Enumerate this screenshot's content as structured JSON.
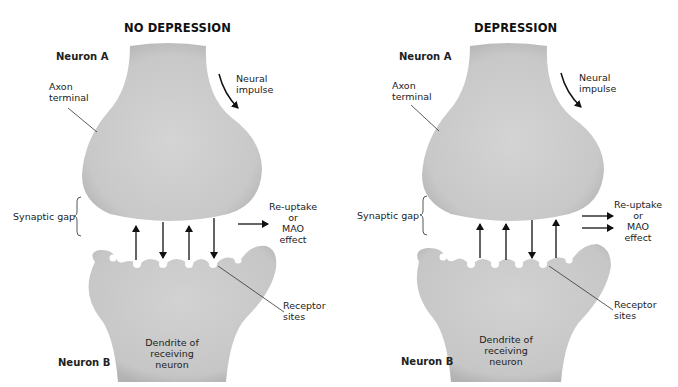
{
  "caption_cut_off": "",
  "colors": {
    "cell_fill": "#cdcdcd",
    "cell_shade": "#b9b9b9",
    "arrow": "#111111",
    "text": "#222222",
    "background": "#ffffff"
  },
  "panels": [
    {
      "title": "NO DEPRESSION",
      "neuron_a": "Neuron A",
      "axon_terminal": [
        "Axon",
        "terminal"
      ],
      "neural_impulse": [
        "Neural",
        "impulse"
      ],
      "synaptic_gap": "Synaptic gap",
      "reuptake": [
        "Re-uptake",
        "or",
        "MAO",
        "effect"
      ],
      "reuptake_arrows": 1,
      "receptor_sites": [
        "Receptor",
        "sites"
      ],
      "dendrite": [
        "Dendrite of",
        "receiving",
        "neuron"
      ],
      "neuron_b": "Neuron B",
      "transmitter_arrows": [
        "up",
        "down",
        "up",
        "down"
      ]
    },
    {
      "title": "DEPRESSION",
      "neuron_a": "Neuron A",
      "axon_terminal": [
        "Axon",
        "terminal"
      ],
      "neural_impulse": [
        "Neural",
        "impulse"
      ],
      "synaptic_gap": "Synaptic gap",
      "reuptake": [
        "Re-uptake",
        "or",
        "MAO",
        "effect"
      ],
      "reuptake_arrows": 2,
      "receptor_sites": [
        "Receptor",
        "sites"
      ],
      "dendrite": [
        "Dendrite of",
        "receiving",
        "neuron"
      ],
      "neuron_b": "Neuron B",
      "transmitter_arrows": [
        "up",
        "up",
        "down",
        "up"
      ]
    }
  ]
}
